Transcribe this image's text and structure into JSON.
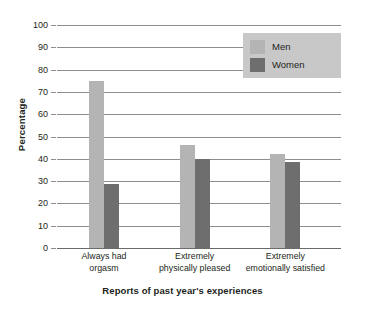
{
  "chart_data": {
    "type": "bar",
    "title": "",
    "xlabel": "Reports of past year's experiences",
    "ylabel": "Percentage",
    "categories": [
      "Always had\norgasm",
      "Extremely\nphysically pleased",
      "Extremely\nemotionally satisfied"
    ],
    "series": [
      {
        "name": "Men",
        "color": "#b4b4b4",
        "values": [
          75,
          46,
          42
        ]
      },
      {
        "name": "Women",
        "color": "#6e6e6e",
        "values": [
          28.5,
          40,
          38.5
        ]
      }
    ],
    "ylim": [
      0,
      100
    ],
    "ytick_labels": [
      "0",
      "10",
      "20",
      "30",
      "40",
      "50",
      "60",
      "70",
      "80",
      "90",
      "100"
    ],
    "ytick_values": [
      0,
      10,
      20,
      30,
      40,
      50,
      60,
      70,
      80,
      90,
      100
    ],
    "grid": true,
    "legend_position": "top-right",
    "legend_background": "#c8c8c8"
  }
}
